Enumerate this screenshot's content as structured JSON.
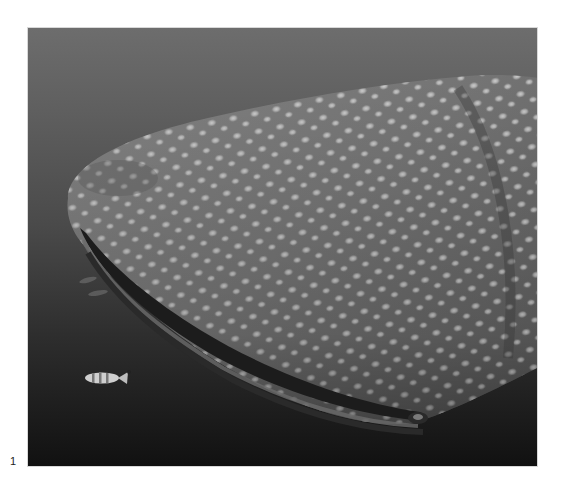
{
  "figure": {
    "number": "1",
    "tones": {
      "water_top": "#6d6d6d",
      "water_bottom": "#111111",
      "shark_skin": "#7a7a7a",
      "spots": "#d9d9d9",
      "mouth_shadow": "#1c1c1c"
    }
  }
}
